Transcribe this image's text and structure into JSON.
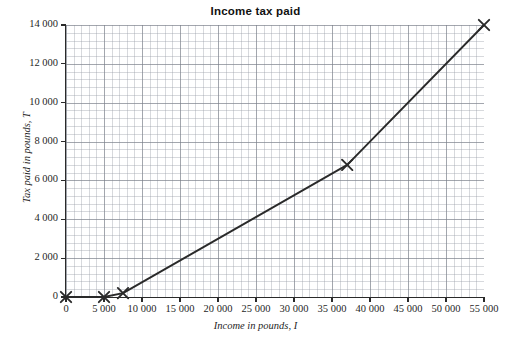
{
  "chart_data": {
    "type": "line",
    "title": "Income tax paid",
    "xlabel": "Income in pounds, I",
    "ylabel": "Tax paid in pounds, T",
    "xlim": [
      0,
      55000
    ],
    "ylim": [
      0,
      14000
    ],
    "grid": true,
    "legend": false,
    "xticks": [
      0,
      5000,
      10000,
      15000,
      20000,
      25000,
      30000,
      35000,
      40000,
      45000,
      50000,
      55000
    ],
    "xticklabels": [
      "0",
      "5 000",
      "10 000",
      "15 000",
      "20 000",
      "25 000",
      "30 000",
      "35 000",
      "40 000",
      "45 000",
      "50 000",
      "55 000"
    ],
    "yticks": [
      0,
      2000,
      4000,
      6000,
      8000,
      10000,
      12000,
      14000
    ],
    "yticklabels": [
      "0",
      "2 000",
      "4 000",
      "6 000",
      "8 000",
      "10 000",
      "12 000",
      "14 000"
    ],
    "series": [
      {
        "name": "Income tax paid",
        "marker": "x",
        "color": "#2a2a2a",
        "x": [
          0,
          5000,
          7500,
          37000,
          55000
        ],
        "y": [
          0,
          0,
          200,
          6800,
          14000
        ],
        "points": [
          {
            "x": 0,
            "y": 0
          },
          {
            "x": 5000,
            "y": 0
          },
          {
            "x": 7500,
            "y": 200
          },
          {
            "x": 37000,
            "y": 6800
          },
          {
            "x": 55000,
            "y": 14000
          }
        ]
      }
    ]
  }
}
